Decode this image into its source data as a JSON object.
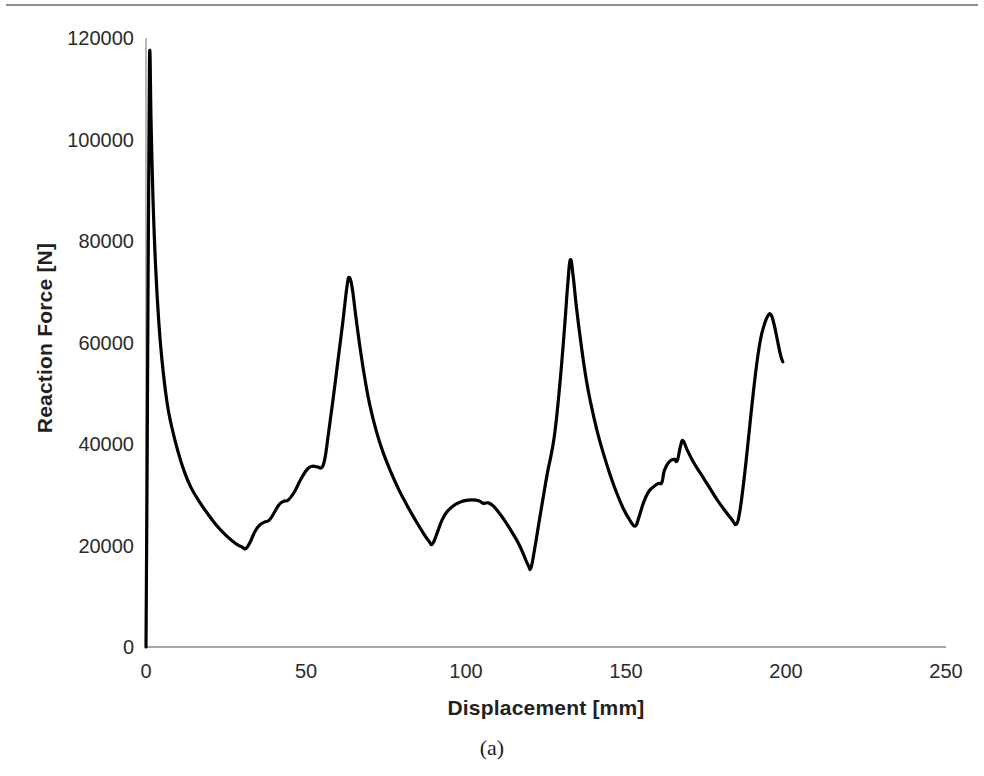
{
  "figure": {
    "caption": "(a)",
    "background_color": "#ffffff",
    "rule_color": "#6f6f6f"
  },
  "chart_data": {
    "type": "line",
    "title": "",
    "subtitle": "",
    "xlabel": "Displacement [mm]",
    "ylabel": "Reaction Force [N]",
    "xlim": [
      0,
      250
    ],
    "ylim": [
      0,
      120000
    ],
    "xticks": [
      0,
      50,
      100,
      150,
      200,
      250
    ],
    "xtick_labels": [
      "0",
      "50",
      "100",
      "150",
      "200",
      "250"
    ],
    "yticks": [
      0,
      20000,
      40000,
      60000,
      80000,
      100000,
      120000
    ],
    "ytick_labels": [
      "0",
      "20000",
      "40000",
      "60000",
      "80000",
      "100000",
      "120000"
    ],
    "grid": false,
    "legend": null,
    "legend_position": "none",
    "line_color": "#000000",
    "line_width": 3.2,
    "annotations": [],
    "series": [
      {
        "name": "Reaction force",
        "points": [
          [
            0.0,
            0
          ],
          [
            0.3,
            30000
          ],
          [
            0.7,
            78000
          ],
          [
            1.1,
            116200
          ],
          [
            1.6,
            103000
          ],
          [
            2.2,
            88000
          ],
          [
            3.0,
            75000
          ],
          [
            4.0,
            64000
          ],
          [
            5.0,
            56500
          ],
          [
            6.5,
            48500
          ],
          [
            8.0,
            43500
          ],
          [
            10.0,
            38500
          ],
          [
            12.0,
            34500
          ],
          [
            14.0,
            31500
          ],
          [
            16.5,
            28800
          ],
          [
            19.0,
            26500
          ],
          [
            22.0,
            24000
          ],
          [
            25.0,
            22000
          ],
          [
            28.0,
            20400
          ],
          [
            30.0,
            19700
          ],
          [
            31.2,
            19400
          ],
          [
            32.5,
            20600
          ],
          [
            34.0,
            22700
          ],
          [
            35.5,
            24000
          ],
          [
            37.0,
            24600
          ],
          [
            38.5,
            25000
          ],
          [
            40.0,
            26400
          ],
          [
            41.5,
            28000
          ],
          [
            43.0,
            28700
          ],
          [
            44.5,
            29000
          ],
          [
            46.5,
            30700
          ],
          [
            48.5,
            33200
          ],
          [
            50.5,
            35100
          ],
          [
            52.0,
            35600
          ],
          [
            53.5,
            35500
          ],
          [
            55.0,
            35400
          ],
          [
            56.0,
            37500
          ],
          [
            57.0,
            42000
          ],
          [
            58.5,
            49000
          ],
          [
            60.0,
            56500
          ],
          [
            61.5,
            64000
          ],
          [
            62.8,
            71000
          ],
          [
            63.6,
            72800
          ],
          [
            64.5,
            70500
          ],
          [
            65.5,
            65500
          ],
          [
            67.0,
            58500
          ],
          [
            68.5,
            52500
          ],
          [
            70.0,
            47500
          ],
          [
            72.0,
            42500
          ],
          [
            74.0,
            38500
          ],
          [
            76.5,
            34500
          ],
          [
            79.0,
            31000
          ],
          [
            81.5,
            28000
          ],
          [
            84.0,
            25200
          ],
          [
            86.5,
            22600
          ],
          [
            88.5,
            20800
          ],
          [
            89.5,
            20300
          ],
          [
            91.0,
            22500
          ],
          [
            92.5,
            25000
          ],
          [
            94.0,
            26600
          ],
          [
            96.0,
            27800
          ],
          [
            98.0,
            28500
          ],
          [
            100.0,
            28900
          ],
          [
            102.0,
            29000
          ],
          [
            104.0,
            28800
          ],
          [
            105.5,
            28300
          ],
          [
            107.0,
            28400
          ],
          [
            108.5,
            27800
          ],
          [
            110.5,
            26300
          ],
          [
            112.5,
            24500
          ],
          [
            114.5,
            22500
          ],
          [
            116.5,
            20300
          ],
          [
            118.0,
            18200
          ],
          [
            119.5,
            16000
          ],
          [
            120.3,
            15600
          ],
          [
            121.5,
            19500
          ],
          [
            122.8,
            24500
          ],
          [
            124.0,
            29000
          ],
          [
            125.5,
            34500
          ],
          [
            126.8,
            38500
          ],
          [
            128.0,
            43500
          ],
          [
            129.5,
            53000
          ],
          [
            130.8,
            63000
          ],
          [
            131.8,
            71500
          ],
          [
            132.6,
            76300
          ],
          [
            133.5,
            73000
          ],
          [
            134.5,
            67000
          ],
          [
            136.0,
            59500
          ],
          [
            137.5,
            53000
          ],
          [
            139.0,
            48000
          ],
          [
            141.0,
            42500
          ],
          [
            143.0,
            38000
          ],
          [
            145.0,
            34000
          ],
          [
            147.0,
            30500
          ],
          [
            149.0,
            27500
          ],
          [
            151.0,
            25200
          ],
          [
            152.8,
            23800
          ],
          [
            154.0,
            25500
          ],
          [
            155.5,
            28500
          ],
          [
            157.0,
            30500
          ],
          [
            158.5,
            31500
          ],
          [
            160.0,
            32200
          ],
          [
            161.2,
            32400
          ],
          [
            162.0,
            34800
          ],
          [
            163.5,
            36500
          ],
          [
            165.0,
            37000
          ],
          [
            166.0,
            36700
          ],
          [
            167.0,
            39500
          ],
          [
            167.8,
            40700
          ],
          [
            169.0,
            39000
          ],
          [
            171.0,
            36500
          ],
          [
            173.5,
            34000
          ],
          [
            176.0,
            31500
          ],
          [
            178.5,
            29000
          ],
          [
            181.0,
            26800
          ],
          [
            183.0,
            25200
          ],
          [
            184.5,
            24200
          ],
          [
            185.5,
            26500
          ],
          [
            186.5,
            31000
          ],
          [
            187.5,
            36500
          ],
          [
            188.5,
            42500
          ],
          [
            189.5,
            48500
          ],
          [
            190.8,
            55500
          ],
          [
            192.0,
            60500
          ],
          [
            193.2,
            63500
          ],
          [
            194.3,
            65200
          ],
          [
            195.3,
            65500
          ],
          [
            196.3,
            63500
          ],
          [
            197.3,
            60500
          ],
          [
            198.3,
            57500
          ],
          [
            199.0,
            56200
          ]
        ]
      }
    ]
  }
}
